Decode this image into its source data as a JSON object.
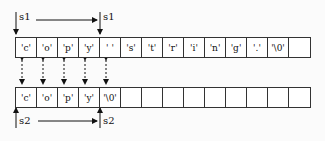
{
  "top_array": {
    "label_start": "s1",
    "label_end": "s1",
    "cells": [
      "'c'",
      "'o'",
      "'p'",
      "'y'",
      "' '",
      "'s'",
      "'t'",
      "'r'",
      "'i'",
      "'n'",
      "'g'",
      "'.'",
      "'\\0'",
      ""
    ]
  },
  "bottom_array": {
    "label_start": "s2",
    "label_end": "s2",
    "cells": [
      "'c'",
      "'o'",
      "'p'",
      "'y'",
      "'\\0'",
      "",
      "",
      "",
      "",
      "",
      "",
      "",
      "",
      ""
    ]
  }
}
